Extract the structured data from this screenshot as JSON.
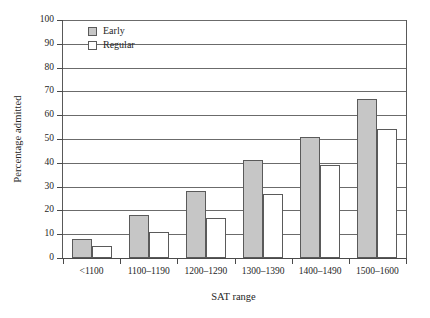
{
  "chart_data": {
    "type": "bar",
    "title": "",
    "xlabel": "SAT range",
    "ylabel": "Percentage admitted",
    "categories": [
      "<1100",
      "1100–1190",
      "1200–1290",
      "1300–1390",
      "1400–1490",
      "1500–1600"
    ],
    "series": [
      {
        "name": "Early",
        "values": [
          8,
          18,
          28,
          41,
          51,
          67
        ]
      },
      {
        "name": "Regular",
        "values": [
          5,
          11,
          17,
          27,
          39,
          54
        ]
      }
    ],
    "ylim": [
      0,
      100
    ],
    "yticks": [
      0,
      10,
      20,
      30,
      40,
      50,
      60,
      70,
      80,
      90,
      100
    ],
    "ytick_labels": [
      "0",
      "10",
      "20",
      "30",
      "40",
      "50",
      "60",
      "70",
      "80",
      "90",
      "100"
    ],
    "grid": true,
    "grid_axis": "y",
    "legend_position": "upper left",
    "colors": {
      "early": "#c6c6c6",
      "regular": "#ffffff",
      "bar_edge": "#5a5a5a",
      "grid": "#6b6b6b",
      "axis": "#4a4a4a",
      "text": "#262626",
      "background": "#ffffff"
    }
  }
}
